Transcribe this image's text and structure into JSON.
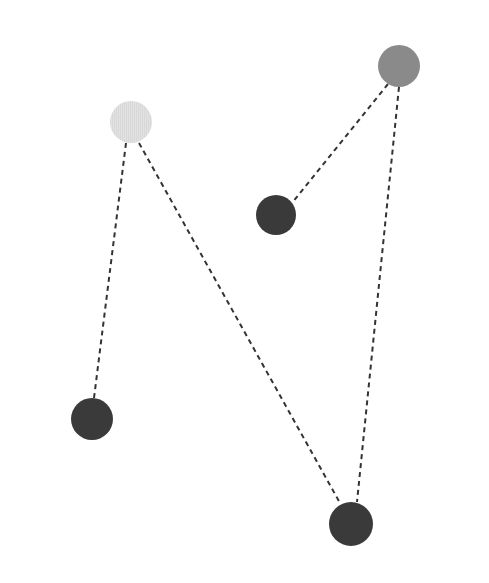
{
  "canvas": {
    "width": 489,
    "height": 583,
    "background_color": "#ffffff",
    "title": "Node-link diagram with five circular nodes and four dashed connecting edges"
  },
  "chart_data": {
    "type": "scatter",
    "title": "",
    "xlabel": "",
    "ylabel": "",
    "xlim": [
      0,
      489
    ],
    "ylim": [
      0,
      583
    ],
    "grid": false,
    "legend": "none",
    "layout": "node-link graph, dashed straight edges, filled circular markers",
    "nodes": [
      {
        "id": "node-light-top-left",
        "label": "light-gray-node",
        "x": 131,
        "y": 122,
        "r": 21,
        "color": "#dedede",
        "shade": "light",
        "texture": "fine vertical striping"
      },
      {
        "id": "node-gray-top-right",
        "label": "medium-gray-node",
        "x": 399,
        "y": 66,
        "r": 21,
        "color": "#8a8a8a",
        "shade": "medium",
        "texture": "solid"
      },
      {
        "id": "node-dark-center",
        "label": "dark-node-center",
        "x": 276,
        "y": 215,
        "r": 20,
        "color": "#3a3a3a",
        "shade": "dark",
        "texture": "solid"
      },
      {
        "id": "node-dark-bottom-left",
        "label": "dark-node-bottom-left",
        "x": 92,
        "y": 419,
        "r": 21,
        "color": "#3a3a3a",
        "shade": "dark",
        "texture": "solid"
      },
      {
        "id": "node-dark-bottom-right",
        "label": "dark-node-bottom-right",
        "x": 351,
        "y": 524,
        "r": 22,
        "color": "#3a3a3a",
        "shade": "dark",
        "texture": "solid"
      }
    ],
    "edges": [
      {
        "id": "edge-light-to-bottom-left",
        "source": "node-light-top-left",
        "target": "node-dark-bottom-left",
        "x1": 126,
        "y1": 143,
        "x2": 94,
        "y2": 398,
        "style": "dashed",
        "color": "#333333",
        "width": 2,
        "dash": "5 4"
      },
      {
        "id": "edge-light-to-bottom-right",
        "source": "node-light-top-left",
        "target": "node-dark-bottom-right",
        "x1": 139,
        "y1": 143,
        "x2": 340,
        "y2": 503,
        "style": "dashed",
        "color": "#333333",
        "width": 2,
        "dash": "5 4"
      },
      {
        "id": "edge-gray-to-center",
        "source": "node-gray-top-right",
        "target": "node-dark-center",
        "x1": 388,
        "y1": 84,
        "x2": 292,
        "y2": 203,
        "style": "dashed",
        "color": "#333333",
        "width": 2,
        "dash": "5 4"
      },
      {
        "id": "edge-gray-to-bottom-right",
        "source": "node-gray-top-right",
        "target": "node-dark-bottom-right",
        "x1": 399,
        "y1": 87,
        "x2": 357,
        "y2": 502,
        "style": "dashed",
        "color": "#333333",
        "width": 2,
        "dash": "5 4"
      }
    ]
  }
}
